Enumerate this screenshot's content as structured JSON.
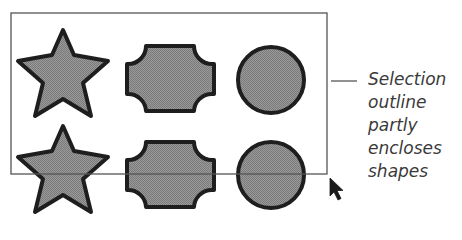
{
  "diagram": {
    "shape_fill": "#8c8c8c",
    "shape_stroke": "#1e1e1e",
    "outline_color": "#555555",
    "selection_outline": {
      "x": 11,
      "y": 13,
      "width": 316,
      "height": 161
    },
    "shapes": [
      {
        "type": "star",
        "row": 1,
        "col": 1
      },
      {
        "type": "cross-octagon",
        "row": 1,
        "col": 2
      },
      {
        "type": "circle",
        "row": 1,
        "col": 3
      },
      {
        "type": "star",
        "row": 2,
        "col": 1
      },
      {
        "type": "cross-octagon",
        "row": 2,
        "col": 2
      },
      {
        "type": "circle",
        "row": 2,
        "col": 3
      }
    ],
    "cursor": "arrow-pointer-icon",
    "callout": {
      "lines": [
        "Selection",
        "outline",
        "partly",
        "encloses",
        "shapes"
      ]
    }
  }
}
